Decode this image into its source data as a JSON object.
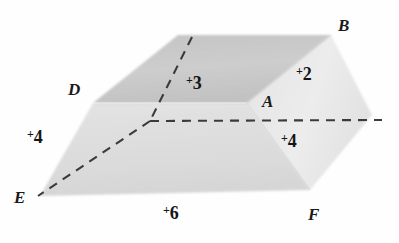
{
  "figure": {
    "background_color": "#fefefe",
    "ink_color": "#1a1a1a",
    "faces": {
      "top_face": {
        "name": "top-face",
        "fill": "#c9c9c9",
        "points": "93,103 178,35 331,35 247,103"
      },
      "front_face": {
        "name": "front-face",
        "fill": "#dedede",
        "points": "93,103 247,103 310,190 40,196"
      },
      "right_face": {
        "name": "right-face",
        "fill": "#e8e8e8",
        "points": "247,103 331,35 372,115 310,190"
      }
    },
    "dashed_lines": [
      {
        "name": "hidden-vertical-edge",
        "from": "192,37",
        "to": "150,121"
      },
      {
        "name": "hidden-horizontal-edge",
        "from": "150,121",
        "to": "382,120"
      },
      {
        "name": "hidden-diagonal-edge",
        "from": "150,121",
        "to": "38,196"
      }
    ],
    "vertex_labels": [
      {
        "name": "vertex-label-b",
        "text": "B",
        "x": 338,
        "y": 17
      },
      {
        "name": "vertex-label-d",
        "text": "D",
        "x": 68,
        "y": 81
      },
      {
        "name": "vertex-label-a",
        "text": "A",
        "x": 262,
        "y": 93
      },
      {
        "name": "vertex-label-e",
        "text": "E",
        "x": 14,
        "y": 189
      },
      {
        "name": "vertex-label-f",
        "text": "F",
        "x": 308,
        "y": 206
      }
    ],
    "edge_labels": [
      {
        "name": "edge-measure-3",
        "plus": "+",
        "value": "3",
        "x": 186,
        "y": 74
      },
      {
        "name": "edge-measure-2",
        "plus": "+",
        "value": "2",
        "x": 296,
        "y": 65
      },
      {
        "name": "edge-measure-4-left",
        "plus": "+",
        "value": "4",
        "x": 27,
        "y": 128
      },
      {
        "name": "edge-measure-4-right",
        "plus": "+",
        "value": "4",
        "x": 281,
        "y": 132
      },
      {
        "name": "edge-measure-6-bottom",
        "plus": "+",
        "value": "6",
        "x": 163,
        "y": 204
      }
    ]
  }
}
